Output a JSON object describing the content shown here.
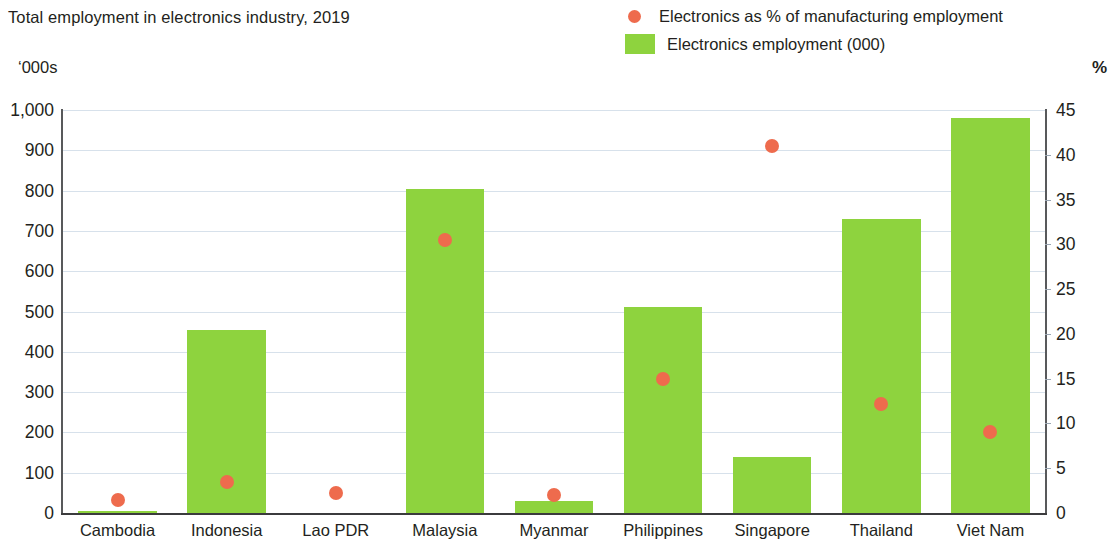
{
  "header": {
    "title": "Total employment in electronics industry, 2019",
    "unit_left": "‘000s",
    "unit_right": "%"
  },
  "legend": {
    "items": [
      {
        "label": "Electronics as % of manufacturing employment",
        "marker": "dot",
        "color": "#ee6b4d"
      },
      {
        "label": "Electronics employment (000)",
        "marker": "swatch",
        "color": "#8ed33e"
      }
    ]
  },
  "colors": {
    "bar": "#8ed33e",
    "dot": "#ee6b4d",
    "axis": "#58595b",
    "grid": "#c9d7e4",
    "text": "#231f20"
  },
  "chart_data": {
    "type": "bar",
    "title": "Total employment in electronics industry, 2019",
    "xlabel": "",
    "ylabel": "'000s",
    "y2label": "%",
    "ylim": [
      0,
      1000
    ],
    "y2lim": [
      0,
      45
    ],
    "grid": true,
    "legend_position": "top-right",
    "categories": [
      "Cambodia",
      "Indonesia",
      "Lao PDR",
      "Malaysia",
      "Myanmar",
      "Philippines",
      "Singapore",
      "Thailand",
      "Viet Nam"
    ],
    "yticks": [
      "0",
      "100",
      "200",
      "300",
      "400",
      "500",
      "600",
      "700",
      "800",
      "900",
      "1,000"
    ],
    "ytick_values": [
      0,
      100,
      200,
      300,
      400,
      500,
      600,
      700,
      800,
      900,
      1000
    ],
    "y2ticks": [
      "0",
      "5",
      "10",
      "15",
      "20",
      "25",
      "30",
      "35",
      "40",
      "45"
    ],
    "y2tick_values": [
      0,
      5,
      10,
      15,
      20,
      25,
      30,
      35,
      40,
      45
    ],
    "series": [
      {
        "name": "Electronics employment (000)",
        "type": "bar",
        "axis": "left",
        "color": "#8ed33e",
        "values": [
          4,
          455,
          0,
          805,
          30,
          510,
          140,
          730,
          980
        ]
      },
      {
        "name": "Electronics as % of manufacturing employment",
        "type": "scatter",
        "axis": "right",
        "color": "#ee6b4d",
        "values": [
          1.5,
          3.5,
          2.2,
          30.5,
          2.0,
          15.0,
          41.0,
          12.2,
          9.0
        ]
      }
    ]
  }
}
